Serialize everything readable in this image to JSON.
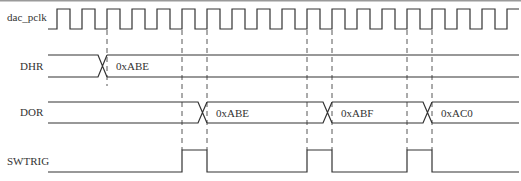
{
  "signals": [
    {
      "id": "clk",
      "label": "dac_pclk",
      "type": "clock"
    },
    {
      "id": "dhr",
      "label": "DHR",
      "type": "bus",
      "values": [
        {
          "at_cycle": 2,
          "value": "0xABE"
        }
      ]
    },
    {
      "id": "dor",
      "label": "DOR",
      "type": "bus",
      "values": [
        {
          "at_cycle": 6,
          "value": "0xABE"
        },
        {
          "at_cycle": 11,
          "value": "0xABF"
        },
        {
          "at_cycle": 15,
          "value": "0xAC0"
        }
      ]
    },
    {
      "id": "swtrig",
      "label": "SWTRIG",
      "type": "pulse",
      "pulses": [
        [
          5,
          6
        ],
        [
          10,
          11
        ],
        [
          14,
          15
        ]
      ]
    }
  ],
  "clock": {
    "cycles": 19
  },
  "markers": {
    "short": [
      2
    ],
    "long": [
      5,
      6,
      10,
      11,
      14,
      15
    ]
  },
  "colors": {
    "line": "#333333",
    "dashed": "#444444",
    "border": "#9a9a9a"
  }
}
